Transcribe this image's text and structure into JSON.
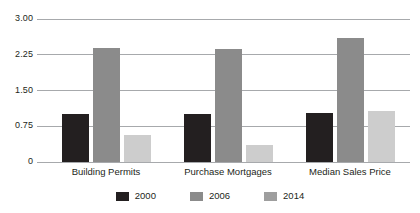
{
  "chart_data": {
    "type": "bar",
    "title": "",
    "subtitle": "",
    "xlabel": "",
    "ylabel": "",
    "categories": [
      "Building Permits",
      "Purchase Mortgages",
      "Median Sales Price"
    ],
    "series": [
      {
        "name": "2000",
        "color": "#231f20",
        "values": [
          1.0,
          1.01,
          1.02
        ]
      },
      {
        "name": "2006",
        "color": "#8b8b8b",
        "values": [
          2.4,
          2.37,
          2.6
        ]
      },
      {
        "name": "2014",
        "color": "#cdcdcd",
        "values": [
          0.57,
          0.36,
          1.07
        ]
      }
    ],
    "ylim": [
      0,
      3.0
    ],
    "yticks": [
      0,
      0.75,
      1.5,
      2.25,
      3.0
    ],
    "ytick_labels": [
      "0",
      "0.75",
      "1.50",
      "2.25",
      "3.00"
    ],
    "grid": true,
    "grid_axis": "y",
    "legend_position": "bottom",
    "legend_entries": [
      "2000",
      "2006",
      "2014"
    ]
  }
}
